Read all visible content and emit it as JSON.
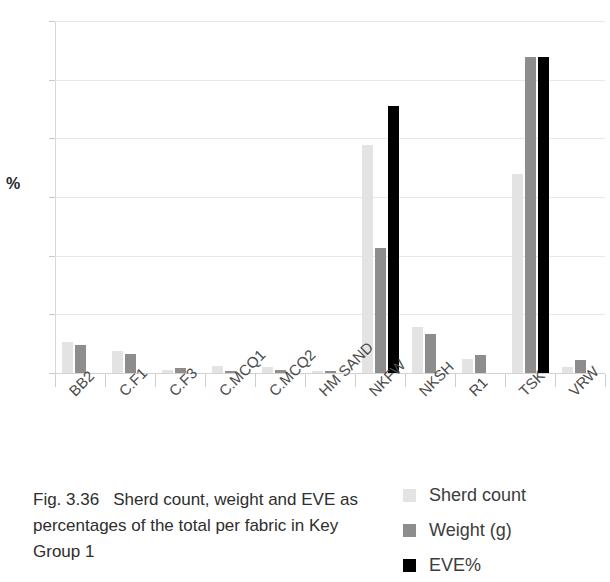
{
  "figure": {
    "caption_number": "Fig. 3.36",
    "caption_text": "Sherd count, weight and EVE as percentages of the total per fabric in Key Group 1"
  },
  "legend": {
    "position": "bottom-right",
    "items": [
      {
        "label": "Sherd count",
        "color": "#e3e3e3"
      },
      {
        "label": "Weight (g)",
        "color": "#8d8d8d"
      },
      {
        "label": "EVE%",
        "color": "#000000"
      }
    ]
  },
  "chart_data": {
    "type": "bar",
    "title": "",
    "subtitle": "",
    "xlabel": "",
    "ylabel": "%",
    "ylim": [
      0,
      60
    ],
    "yticks": [
      0,
      10,
      20,
      30,
      40,
      50,
      60
    ],
    "ytick_labels": [
      "0",
      "10",
      "20",
      "30",
      "40",
      "50",
      "60"
    ],
    "grid": true,
    "grid_axis": "y",
    "legend_position": "bottom-right",
    "categories": [
      "BB2",
      "C.F1",
      "C.F3",
      "C.MCQ1",
      "C.MCQ2",
      "HM SAND",
      "NKFW",
      "NKSH",
      "R1",
      "TSK",
      "VRW"
    ],
    "series": [
      {
        "name": "Sherd count",
        "color": "#e3e3e3",
        "values": [
          5.3,
          3.8,
          0.5,
          1.2,
          1.1,
          0.4,
          38.8,
          7.9,
          2.4,
          33.9,
          1.0
        ]
      },
      {
        "name": "Weight (g)",
        "color": "#8d8d8d",
        "values": [
          4.8,
          3.3,
          0.8,
          0.3,
          0.5,
          0.4,
          21.3,
          6.6,
          3.0,
          53.8,
          2.2
        ]
      },
      {
        "name": "EVE%",
        "color": "#000000",
        "values": [
          0,
          0,
          0,
          0,
          0,
          0,
          45.5,
          0,
          0,
          53.8,
          0
        ]
      }
    ]
  }
}
